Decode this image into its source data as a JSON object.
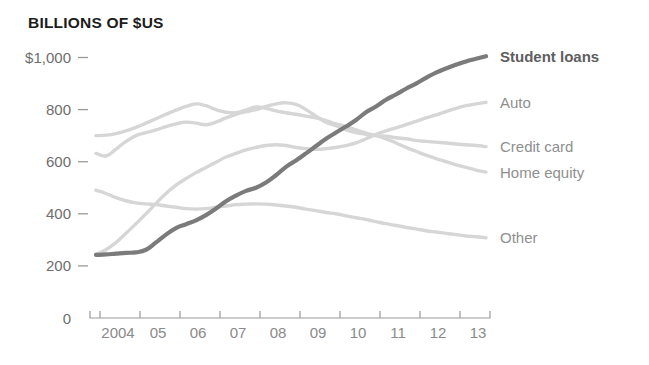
{
  "chart_data": {
    "type": "line",
    "title": "BILLIONS OF $US",
    "xlabel": "",
    "ylabel": "",
    "ylim": [
      0,
      1000
    ],
    "xlim": [
      2003.75,
      2013.75
    ],
    "grid": false,
    "legend_position": "right-of-plot-line-end",
    "y_ticks": [
      {
        "value": 1000,
        "label": "$1,000"
      },
      {
        "value": 800,
        "label": "800"
      },
      {
        "value": 600,
        "label": "600"
      },
      {
        "value": 400,
        "label": "400"
      },
      {
        "value": 200,
        "label": "200"
      },
      {
        "value": 0,
        "label": "0"
      }
    ],
    "x_ticks": [
      {
        "value": 2004,
        "label": "2004"
      },
      {
        "value": 2005,
        "label": "05"
      },
      {
        "value": 2006,
        "label": "06"
      },
      {
        "value": 2007,
        "label": "07"
      },
      {
        "value": 2008,
        "label": "08"
      },
      {
        "value": 2009,
        "label": "09"
      },
      {
        "value": 2010,
        "label": "10"
      },
      {
        "value": 2011,
        "label": "11"
      },
      {
        "value": 2012,
        "label": "12"
      },
      {
        "value": 2013,
        "label": "13"
      }
    ],
    "x": [
      2003.9,
      2004.15,
      2004.4,
      2004.65,
      2004.9,
      2005.15,
      2005.4,
      2005.65,
      2005.9,
      2006.15,
      2006.4,
      2006.65,
      2006.9,
      2007.15,
      2007.4,
      2007.65,
      2007.9,
      2008.15,
      2008.4,
      2008.65,
      2008.9,
      2009.15,
      2009.4,
      2009.65,
      2009.9,
      2010.15,
      2010.4,
      2010.65,
      2010.9,
      2011.15,
      2011.4,
      2011.65,
      2011.9,
      2012.15,
      2012.4,
      2012.65,
      2012.9,
      2013.15,
      2013.4,
      2013.65
    ],
    "series": [
      {
        "name": "Student loans",
        "color": "#7b7b7b",
        "width": 4.2,
        "emphasis": true,
        "label_y": 1005,
        "values": [
          242,
          244,
          247,
          250,
          252,
          262,
          290,
          320,
          345,
          360,
          375,
          395,
          420,
          448,
          470,
          488,
          500,
          520,
          548,
          580,
          605,
          632,
          660,
          688,
          712,
          735,
          760,
          790,
          812,
          838,
          858,
          880,
          900,
          922,
          942,
          958,
          972,
          985,
          995,
          1005
        ]
      },
      {
        "name": "Auto",
        "color": "#d6d6d6",
        "width": 3.4,
        "emphasis": false,
        "label_y": 828,
        "values": [
          245,
          262,
          290,
          325,
          362,
          400,
          440,
          478,
          510,
          535,
          558,
          578,
          598,
          618,
          632,
          645,
          655,
          662,
          665,
          662,
          655,
          650,
          648,
          650,
          655,
          662,
          672,
          688,
          705,
          718,
          730,
          742,
          755,
          768,
          780,
          792,
          805,
          815,
          822,
          828
        ]
      },
      {
        "name": "Credit card",
        "color": "#d6d6d6",
        "width": 3.4,
        "emphasis": false,
        "label_y": 658,
        "values": [
          632,
          622,
          648,
          678,
          700,
          712,
          722,
          735,
          745,
          752,
          748,
          742,
          752,
          768,
          782,
          792,
          800,
          812,
          822,
          826,
          820,
          800,
          775,
          752,
          738,
          722,
          712,
          705,
          700,
          698,
          692,
          688,
          682,
          678,
          675,
          672,
          668,
          665,
          662,
          658
        ]
      },
      {
        "name": "Home equity",
        "color": "#d6d6d6",
        "width": 3.4,
        "emphasis": false,
        "label_y": 560,
        "values": [
          700,
          702,
          708,
          718,
          732,
          748,
          765,
          782,
          798,
          812,
          822,
          815,
          800,
          790,
          788,
          798,
          810,
          805,
          795,
          788,
          782,
          775,
          768,
          758,
          745,
          735,
          722,
          710,
          700,
          688,
          672,
          655,
          640,
          625,
          612,
          600,
          588,
          578,
          568,
          560
        ]
      },
      {
        "name": "Other",
        "color": "#d6d6d6",
        "width": 3.4,
        "emphasis": false,
        "label_y": 308,
        "values": [
          490,
          478,
          462,
          450,
          442,
          438,
          435,
          430,
          425,
          420,
          418,
          420,
          425,
          430,
          435,
          437,
          438,
          437,
          434,
          430,
          425,
          418,
          412,
          405,
          400,
          392,
          385,
          378,
          370,
          362,
          355,
          348,
          342,
          335,
          330,
          325,
          320,
          315,
          312,
          308
        ]
      }
    ]
  }
}
